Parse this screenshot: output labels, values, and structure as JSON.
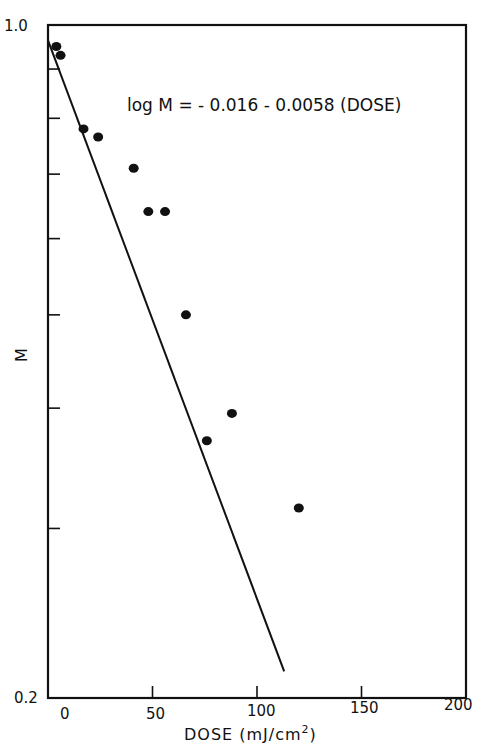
{
  "chart_data": {
    "type": "scatter",
    "title": "",
    "xlabel": "DOSE (mJ/cm2)",
    "ylabel": "M",
    "xlim": [
      0,
      200
    ],
    "ylim": [
      0.2,
      1.0
    ],
    "yscale": "log",
    "grid": false,
    "x_ticks": [
      0,
      50,
      100,
      150,
      200
    ],
    "x_tick_labels": [
      "0",
      "50",
      "100",
      "150",
      "200"
    ],
    "y_ticks": [
      0.2,
      0.3,
      0.4,
      0.5,
      0.6,
      0.7,
      0.8,
      0.9,
      1.0
    ],
    "y_tick_labels": [
      "0.2",
      "",
      "",
      "",
      "",
      "",
      "",
      "",
      "1.0"
    ],
    "series": [
      {
        "name": "measured",
        "marker": "filled-circle",
        "points": [
          {
            "x": 4,
            "y": 0.95
          },
          {
            "x": 6,
            "y": 0.93
          },
          {
            "x": 17,
            "y": 0.78
          },
          {
            "x": 24,
            "y": 0.765
          },
          {
            "x": 41,
            "y": 0.71
          },
          {
            "x": 48,
            "y": 0.64
          },
          {
            "x": 56,
            "y": 0.64
          },
          {
            "x": 66,
            "y": 0.5
          },
          {
            "x": 76,
            "y": 0.37
          },
          {
            "x": 88,
            "y": 0.395
          },
          {
            "x": 120,
            "y": 0.315
          }
        ]
      },
      {
        "name": "fit",
        "type": "line",
        "equation": "log M = -0.016 - 0.0058 (DOSE)",
        "x_range": [
          0,
          113
        ]
      }
    ],
    "annotations": [
      {
        "text": "log M = - 0.016 - 0.0058 (DOSE)",
        "x": 110,
        "y": 0.91
      }
    ]
  },
  "labels": {
    "equation": "log M = - 0.016 - 0.0058 (DOSE)",
    "xlabel_main": "DOSE (mJ/cm",
    "xlabel_sup": "2",
    "xlabel_close": ")",
    "ylabel": "M",
    "y_top": "1.0",
    "y_bottom": "0.2",
    "x0": "0",
    "x50": "50",
    "x100": "100",
    "x150": "150",
    "x200": "200"
  }
}
